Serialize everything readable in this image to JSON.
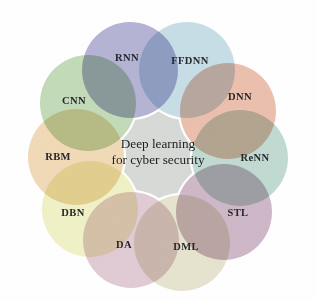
{
  "figure": {
    "name": "deep-learning-for-cyber-security-venn",
    "background_color": "#ffffff",
    "center": {
      "label_line1": "Deep learning",
      "label_line2": "for cyber security",
      "fill_color": "#d7dad7",
      "cx": 158,
      "cy": 152,
      "radius": 66
    },
    "petal_radius": 48,
    "ring_radius": 82,
    "text_color": "#26262c",
    "rim_color": "#ffffff",
    "nodes": [
      {
        "id": "rnn",
        "label": "RNN",
        "color": "#a9a8ce",
        "cx": 130,
        "cy": 70,
        "label_x": 127,
        "label_y": 57,
        "angle_deg": -113
      },
      {
        "id": "ffdnn",
        "label": "FFDNN",
        "color": "#bfd8e3",
        "cx": 187,
        "cy": 70,
        "label_x": 190,
        "label_y": 60,
        "angle_deg": -67
      },
      {
        "id": "dnn",
        "label": "DNN",
        "color": "#e8b6a2",
        "cx": 228,
        "cy": 111,
        "label_x": 240,
        "label_y": 96,
        "angle_deg": -27
      },
      {
        "id": "renn",
        "label": "ReNN",
        "color": "#b8d5cb",
        "cx": 240,
        "cy": 158,
        "label_x": 255,
        "label_y": 157,
        "angle_deg": 5
      },
      {
        "id": "stl",
        "label": "STL",
        "color": "#c7aec0",
        "cx": 224,
        "cy": 212,
        "label_x": 238,
        "label_y": 212,
        "angle_deg": 47
      },
      {
        "id": "dml",
        "label": "DML",
        "color": "#e2e0c6",
        "cx": 182,
        "cy": 243,
        "label_x": 186,
        "label_y": 246,
        "angle_deg": 77
      },
      {
        "id": "da",
        "label": "DA",
        "color": "#dcc4cf",
        "cx": 131,
        "cy": 240,
        "label_x": 124,
        "label_y": 244,
        "angle_deg": 110
      },
      {
        "id": "dbn",
        "label": "DBN",
        "color": "#efefbe",
        "cx": 90,
        "cy": 209,
        "label_x": 73,
        "label_y": 212,
        "angle_deg": 143
      },
      {
        "id": "rbm",
        "label": "RBM",
        "color": "#edd4ab",
        "cx": 76,
        "cy": 157,
        "label_x": 58,
        "label_y": 156,
        "angle_deg": 180
      },
      {
        "id": "cnn",
        "label": "CNN",
        "color": "#b9d5ae",
        "cx": 88,
        "cy": 103,
        "label_x": 74,
        "label_y": 100,
        "angle_deg": -148
      }
    ]
  }
}
